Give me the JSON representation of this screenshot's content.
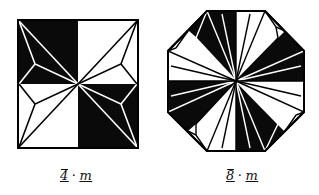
{
  "figures": [
    {
      "id": "square",
      "shape": "square",
      "label": {
        "symbol": "4",
        "separator": "·",
        "mirror": "m",
        "full": "4̄·m"
      }
    },
    {
      "id": "octagon",
      "shape": "octagon",
      "label": {
        "symbol": "8",
        "separator": "·",
        "mirror": "m",
        "full": "8̄·m"
      }
    }
  ],
  "colors": {
    "fill": "#0a0a0a",
    "background": "#ffffff",
    "line": "#ffffff"
  }
}
